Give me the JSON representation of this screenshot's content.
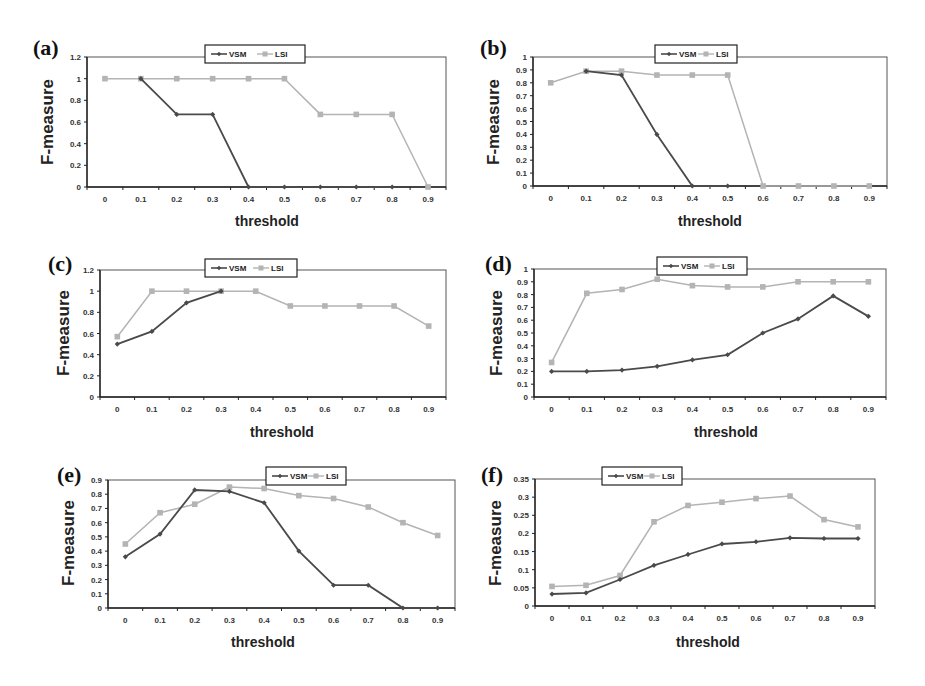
{
  "figure": {
    "legend": {
      "vsm_label": "VSM",
      "lsi_label": "LSI"
    },
    "colors": {
      "vsm": "#4a4a4a",
      "lsi": "#b4b4b4",
      "frame": "#555555"
    },
    "xlabel": "threshold",
    "ylabel": "F-measure"
  },
  "chart_data": [
    {
      "panel": "(a)",
      "type": "line",
      "title": "",
      "xlabel": "threshold",
      "ylabel": "F-measure",
      "categories": [
        "0",
        "0.1",
        "0.2",
        "0.3",
        "0.4",
        "0.5",
        "0.6",
        "0.7",
        "0.8",
        "0.9"
      ],
      "ylim": [
        0,
        1.2
      ],
      "yticks": [
        "0",
        "0.2",
        "0.4",
        "0.6",
        "0.8",
        "1",
        "1.2"
      ],
      "grid": false,
      "legend_position": "top-center",
      "series": [
        {
          "name": "VSM",
          "values": [
            null,
            1.0,
            0.67,
            0.67,
            0.0,
            0.0,
            0.0,
            0.0,
            0.0,
            null
          ]
        },
        {
          "name": "LSI",
          "values": [
            1.0,
            1.0,
            1.0,
            1.0,
            1.0,
            1.0,
            0.67,
            0.67,
            0.67,
            0.0
          ]
        }
      ]
    },
    {
      "panel": "(b)",
      "type": "line",
      "title": "",
      "xlabel": "threshold",
      "ylabel": "F-measure",
      "categories": [
        "0",
        "0.1",
        "0.2",
        "0.3",
        "0.4",
        "0.5",
        "0.6",
        "0.7",
        "0.8",
        "0.9"
      ],
      "ylim": [
        0,
        1
      ],
      "yticks": [
        "0",
        "0.1",
        "0.2",
        "0.3",
        "0.4",
        "0.5",
        "0.6",
        "0.7",
        "0.8",
        "0.9",
        "1"
      ],
      "grid": false,
      "legend_position": "top-center",
      "series": [
        {
          "name": "VSM",
          "values": [
            null,
            0.89,
            0.86,
            0.4,
            0.0,
            0.0,
            null,
            null,
            null,
            null
          ]
        },
        {
          "name": "LSI",
          "values": [
            0.8,
            0.89,
            0.89,
            0.86,
            0.86,
            0.86,
            0.0,
            0.0,
            0.0,
            0.0
          ]
        }
      ]
    },
    {
      "panel": "(c)",
      "type": "line",
      "title": "",
      "xlabel": "threshold",
      "ylabel": "F-measure",
      "categories": [
        "0",
        "0.1",
        "0.2",
        "0.3",
        "0.4",
        "0.5",
        "0.6",
        "0.7",
        "0.8",
        "0.9"
      ],
      "ylim": [
        0,
        1.2
      ],
      "yticks": [
        "0",
        "0.2",
        "0.4",
        "0.6",
        "0.8",
        "1",
        "1.2"
      ],
      "grid": false,
      "legend_position": "top-center",
      "series": [
        {
          "name": "VSM",
          "values": [
            0.5,
            0.62,
            0.89,
            1.0,
            null,
            null,
            null,
            null,
            null,
            null
          ]
        },
        {
          "name": "LSI",
          "values": [
            0.57,
            1.0,
            1.0,
            1.0,
            1.0,
            0.86,
            0.86,
            0.86,
            0.86,
            0.67
          ]
        }
      ]
    },
    {
      "panel": "(d)",
      "type": "line",
      "title": "",
      "xlabel": "threshold",
      "ylabel": "F-measure",
      "categories": [
        "0",
        "0.1",
        "0.2",
        "0.3",
        "0.4",
        "0.5",
        "0.6",
        "0.7",
        "0.8",
        "0.9"
      ],
      "ylim": [
        0,
        1
      ],
      "yticks": [
        "0",
        "0.1",
        "0.2",
        "0.3",
        "0.4",
        "0.5",
        "0.6",
        "0.7",
        "0.8",
        "0.9",
        "1"
      ],
      "grid": false,
      "legend_position": "top-center",
      "series": [
        {
          "name": "VSM",
          "values": [
            0.2,
            0.2,
            0.21,
            0.24,
            0.29,
            0.33,
            0.5,
            0.61,
            0.79,
            0.63
          ]
        },
        {
          "name": "LSI",
          "values": [
            0.27,
            0.81,
            0.84,
            0.92,
            0.87,
            0.86,
            0.86,
            0.9,
            0.9,
            0.9
          ]
        }
      ]
    },
    {
      "panel": "(e)",
      "type": "line",
      "title": "",
      "xlabel": "threshold",
      "ylabel": "F-measure",
      "categories": [
        "0",
        "0.1",
        "0.2",
        "0.3",
        "0.4",
        "0.5",
        "0.6",
        "0.7",
        "0.8",
        "0.9"
      ],
      "ylim": [
        0,
        0.9
      ],
      "yticks": [
        "0",
        "0.1",
        "0.2",
        "0.3",
        "0.4",
        "0.5",
        "0.6",
        "0.7",
        "0.8",
        "0.9"
      ],
      "grid": false,
      "legend_position": "top-right",
      "series": [
        {
          "name": "VSM",
          "values": [
            0.36,
            0.52,
            0.83,
            0.82,
            0.74,
            0.4,
            0.16,
            0.16,
            0.0,
            0.0
          ]
        },
        {
          "name": "LSI",
          "values": [
            0.45,
            0.67,
            0.73,
            0.85,
            0.84,
            0.79,
            0.77,
            0.71,
            0.6,
            0.51
          ]
        }
      ]
    },
    {
      "panel": "(f)",
      "type": "line",
      "title": "",
      "xlabel": "threshold",
      "ylabel": "F-measure",
      "categories": [
        "0",
        "0.1",
        "0.2",
        "0.3",
        "0.4",
        "0.5",
        "0.6",
        "0.7",
        "0.8",
        "0.9"
      ],
      "ylim": [
        0,
        0.35
      ],
      "yticks": [
        "0",
        "0.05",
        "0.1",
        "0.15",
        "0.2",
        "0.25",
        "0.3",
        "0.35"
      ],
      "grid": false,
      "legend_position": "top-left",
      "series": [
        {
          "name": "VSM",
          "values": [
            0.033,
            0.036,
            0.073,
            0.112,
            0.142,
            0.171,
            0.177,
            0.188,
            0.186,
            0.186
          ]
        },
        {
          "name": "LSI",
          "values": [
            0.054,
            0.057,
            0.084,
            0.232,
            0.277,
            0.286,
            0.296,
            0.303,
            0.238,
            0.218
          ]
        }
      ]
    }
  ]
}
